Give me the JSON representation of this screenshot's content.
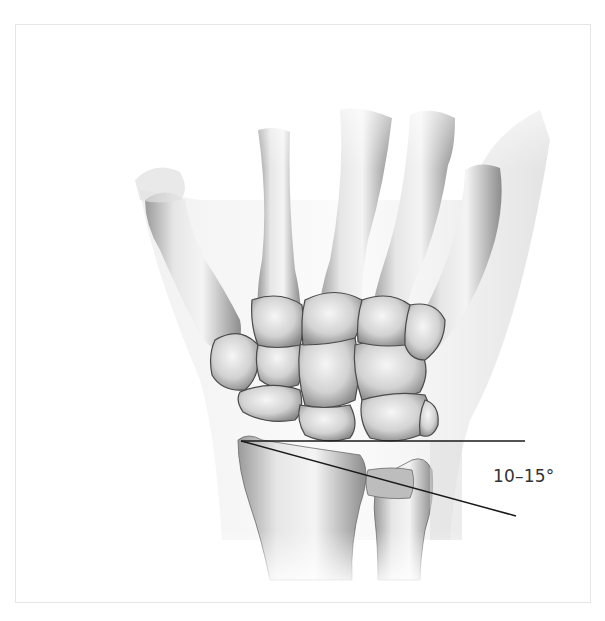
{
  "figure": {
    "angle_label": "10–15°",
    "colors": {
      "line": "#1a1a1a",
      "bone_light": "#f2f2f2",
      "bone_mid": "#c8c8c8",
      "bone_dark": "#7a7a7a",
      "soft_tissue": "#ececec",
      "frame_border": "#e6e6e6"
    },
    "annotations": [
      {
        "name": "reference-horizontal-line",
        "description": "horizontal line perpendicular to radius axis"
      },
      {
        "name": "radial-inclination-line",
        "description": "line along distal radius articular surface"
      }
    ]
  }
}
